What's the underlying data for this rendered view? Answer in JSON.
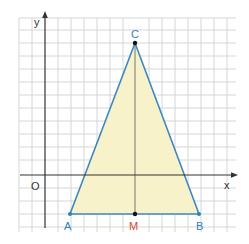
{
  "figure": {
    "axes": {
      "x_label": "x",
      "y_label": "y",
      "origin_label": "O"
    },
    "points": {
      "A": {
        "label": "A",
        "color": "#2f7fb8"
      },
      "B": {
        "label": "B",
        "color": "#2f7fb8"
      },
      "C": {
        "label": "C",
        "color": "#2f7fb8"
      },
      "M": {
        "label": "M",
        "color": "#d9472b"
      }
    },
    "colors": {
      "grid": "#d6d6d6",
      "axis": "#333333",
      "triangle_stroke": "#3d87c2",
      "triangle_fill": "#f7f2c9",
      "median": "#555555"
    }
  }
}
